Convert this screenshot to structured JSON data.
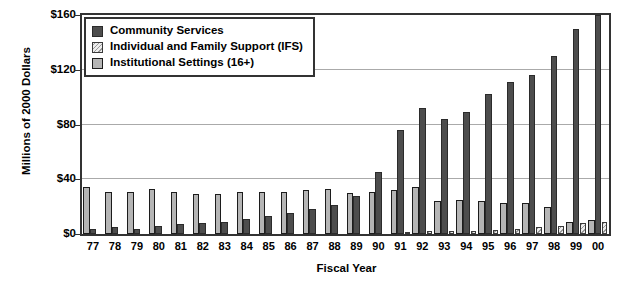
{
  "chart_data": {
    "type": "bar",
    "title": "",
    "xlabel": "Fiscal Year",
    "ylabel": "Millions of 2000 Dollars",
    "ylim": [
      0,
      160
    ],
    "yticks": [
      0,
      40,
      80,
      120,
      160
    ],
    "ytick_labels": [
      "$0",
      "$40",
      "$80",
      "$120",
      "$160"
    ],
    "grid": true,
    "legend_position": "top-left",
    "categories": [
      "77",
      "78",
      "79",
      "80",
      "81",
      "82",
      "83",
      "84",
      "85",
      "86",
      "87",
      "88",
      "89",
      "90",
      "91",
      "92",
      "93",
      "94",
      "95",
      "96",
      "97",
      "98",
      "99",
      "00"
    ],
    "series": [
      {
        "name": "Community Services",
        "color": "#4d4d4d",
        "values": [
          4,
          5,
          4,
          6,
          7,
          8,
          9,
          11,
          13,
          15,
          18,
          21,
          28,
          45,
          76,
          92,
          84,
          89,
          102,
          111,
          116,
          130,
          150,
          160
        ]
      },
      {
        "name": "Individual and Family Support (IFS)",
        "color": "#ededed",
        "values": [
          0,
          0,
          0,
          0,
          0,
          0,
          0,
          0,
          0,
          0,
          0,
          0,
          0,
          0,
          1,
          2,
          2,
          2,
          3,
          4,
          5,
          6,
          8,
          9
        ]
      },
      {
        "name": "Institutional Settings (16+)",
        "color": "#b5b5b5",
        "values": [
          34,
          31,
          31,
          33,
          31,
          29,
          29,
          31,
          31,
          31,
          32,
          33,
          30,
          31,
          32,
          34,
          24,
          25,
          24,
          23,
          23,
          20,
          9,
          10
        ]
      }
    ]
  },
  "legend": {
    "items": [
      {
        "label": "Community Services",
        "swatch": "community"
      },
      {
        "label": "Individual and Family Support (IFS)",
        "swatch": "ifs"
      },
      {
        "label": "Institutional Settings (16+)",
        "swatch": "institutional"
      }
    ]
  },
  "axes": {
    "y_title": "Millions of 2000 Dollars",
    "x_title": "Fiscal Year"
  }
}
